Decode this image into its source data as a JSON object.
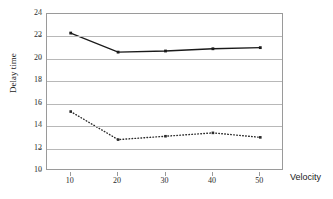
{
  "chart_data": {
    "type": "line",
    "title": "",
    "xlabel": "Velocity",
    "ylabel": "Delay time",
    "x": [
      10,
      20,
      30,
      40,
      50
    ],
    "xtick_labels": [
      "10",
      "20",
      "30",
      "40",
      "50"
    ],
    "ytick_labels": [
      "24",
      "22",
      "20",
      "18",
      "16",
      "14",
      "12",
      "10"
    ],
    "yticks": [
      24,
      22,
      20,
      18,
      16,
      14,
      12,
      10
    ],
    "xlim": [
      5,
      55
    ],
    "ylim": [
      10,
      24
    ],
    "grid": true,
    "legend": "none",
    "series": [
      {
        "name": "solid-series",
        "style": "solid",
        "color": "#1a1a1a",
        "marker": "square",
        "values": [
          22.3,
          20.6,
          20.7,
          20.9,
          21.0
        ]
      },
      {
        "name": "dotted-series",
        "style": "dotted",
        "color": "#2a2a2a",
        "marker": "square",
        "values": [
          15.3,
          12.8,
          13.1,
          13.4,
          13.0
        ]
      }
    ]
  },
  "axis": {
    "y_title": "Delay time",
    "x_title": "Velocity"
  }
}
